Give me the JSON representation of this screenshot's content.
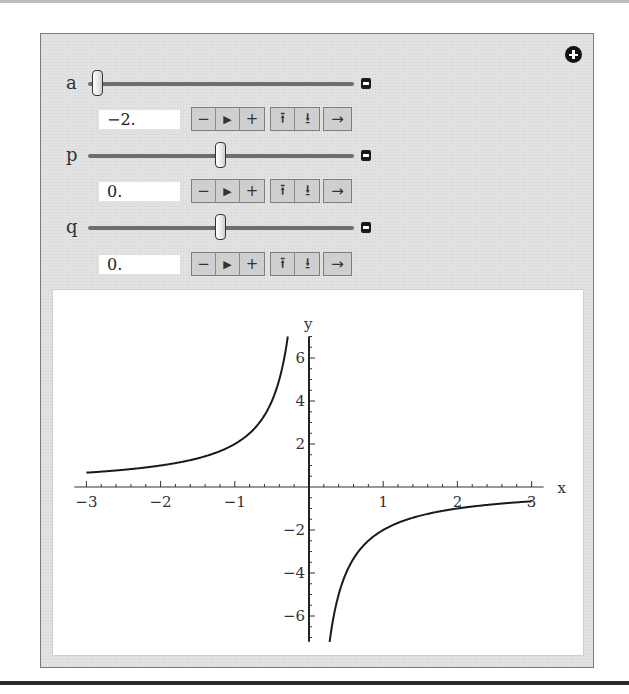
{
  "controls": {
    "add_button_icon": "plus-circle-icon",
    "variables": [
      {
        "name": "a",
        "value": "−2.",
        "slider_position": 0.0
      },
      {
        "name": "p",
        "value": "0.",
        "slider_position": 0.5
      },
      {
        "name": "q",
        "value": "0.",
        "slider_position": 0.5
      }
    ],
    "button_labels": {
      "decrement": "−",
      "play": "▶",
      "increment": "+",
      "faster": "⭱",
      "slower": "⭳",
      "direction": "→"
    }
  },
  "chart_data": {
    "type": "line",
    "title": "",
    "xlabel": "x",
    "ylabel": "y",
    "function": "y = a/(x - p) + q with a = -2, p = 0, q = 0",
    "xlim": [
      -3,
      3
    ],
    "ylim": [
      -7.2,
      7.0
    ],
    "x_ticks": [
      "−3",
      "−2",
      "−1",
      "1",
      "2",
      "3"
    ],
    "x_tick_values": [
      -3,
      -2,
      -1,
      1,
      2,
      3
    ],
    "y_ticks": [
      "6",
      "4",
      "2",
      "−2",
      "−4",
      "−6"
    ],
    "y_tick_values": [
      6,
      4,
      2,
      -2,
      -4,
      -6
    ],
    "grid": false,
    "legend": null,
    "series": [
      {
        "name": "left branch",
        "x": [
          -3,
          -2.5,
          -2,
          -1.5,
          -1,
          -0.75,
          -0.5,
          -0.4,
          -0.3
        ],
        "values": [
          0.667,
          0.8,
          1.0,
          1.333,
          2.0,
          2.667,
          4.0,
          5.0,
          6.667
        ]
      },
      {
        "name": "right branch",
        "x": [
          0.28,
          0.35,
          0.5,
          0.75,
          1,
          1.5,
          2,
          2.5,
          3
        ],
        "values": [
          -7.14,
          -5.71,
          -4.0,
          -2.667,
          -2.0,
          -1.333,
          -1.0,
          -0.8,
          -0.667
        ]
      }
    ]
  }
}
